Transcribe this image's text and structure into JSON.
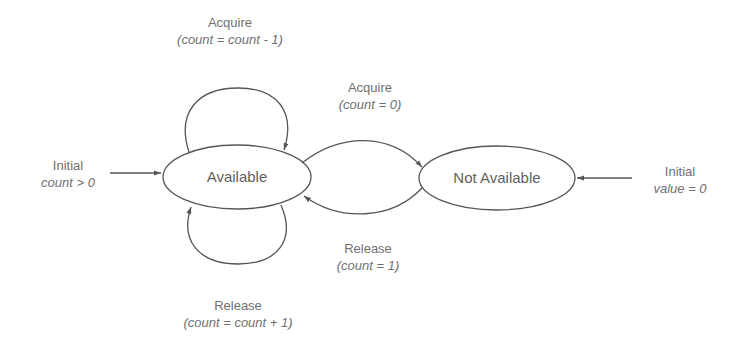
{
  "diagram": {
    "type": "state-machine",
    "states": [
      {
        "id": "available",
        "label": "Available"
      },
      {
        "id": "not_available",
        "label": "Not Available"
      }
    ],
    "initial_left": {
      "name": "Initial",
      "cond": "count > 0"
    },
    "initial_right": {
      "name": "Initial",
      "cond": "value = 0"
    },
    "transitions": {
      "acquire_self": {
        "name": "Acquire",
        "cond": "(count =  count - 1)"
      },
      "acquire_to_na": {
        "name": "Acquire",
        "cond": "(count = 0)"
      },
      "release_to_av": {
        "name": "Release",
        "cond": "(count = 1)"
      },
      "release_self": {
        "name": "Release",
        "cond": "(count =  count + 1)"
      }
    },
    "colors": {
      "stroke": "#555555",
      "text": "#6f6f6f",
      "background": "#ffffff"
    }
  }
}
